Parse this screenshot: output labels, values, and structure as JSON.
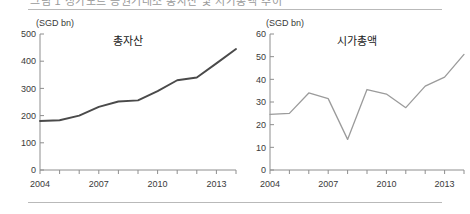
{
  "header": {
    "clipped_caption": "그림 1  싱가포르 증권거래소 총자산 및 시가총액 추이",
    "rule_color": "#b9b9b9"
  },
  "charts": [
    {
      "id": "total-assets",
      "unit_label": "(SGD bn)",
      "title": "총자산",
      "line_color": "#4a4a4a",
      "chart_data": {
        "type": "line",
        "title": "총자산",
        "xlabel": "",
        "ylabel": "(SGD bn)",
        "x": [
          2004,
          2005,
          2006,
          2007,
          2008,
          2009,
          2010,
          2011,
          2012,
          2013,
          2014
        ],
        "values": [
          180,
          183,
          200,
          232,
          252,
          256,
          290,
          330,
          340,
          392,
          445
        ],
        "xlim": [
          2004,
          2014
        ],
        "ylim": [
          0,
          500
        ],
        "yticks": [
          0,
          100,
          200,
          300,
          400,
          500
        ],
        "xtick_labels": [
          "2004",
          "2007",
          "2010",
          "2013"
        ],
        "xtick_label_years": [
          2004,
          2007,
          2010,
          2013
        ],
        "grid": false,
        "legend": false
      }
    },
    {
      "id": "market-cap",
      "unit_label": "(SGD bn)",
      "title": "시가총액",
      "line_color": "#9b9b9b",
      "chart_data": {
        "type": "line",
        "title": "시가총액",
        "xlabel": "",
        "ylabel": "(SGD bn)",
        "x": [
          2004,
          2005,
          2006,
          2007,
          2008,
          2009,
          2010,
          2011,
          2012,
          2013,
          2014
        ],
        "values": [
          24.5,
          25,
          34,
          31.5,
          13.5,
          35.5,
          33.5,
          27.5,
          37,
          41,
          51
        ],
        "xlim": [
          2004,
          2014
        ],
        "ylim": [
          0,
          60
        ],
        "yticks": [
          0,
          10,
          20,
          30,
          40,
          50,
          60
        ],
        "xtick_labels": [
          "2004",
          "2007",
          "2010",
          "2013"
        ],
        "xtick_label_years": [
          2004,
          2007,
          2010,
          2013
        ],
        "grid": false,
        "legend": false
      }
    }
  ]
}
